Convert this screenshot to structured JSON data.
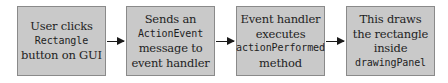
{
  "diagram": {
    "type": "flowchart",
    "direction": "left-to-right",
    "colors": {
      "box_fill": "#c9c9c9",
      "box_border": "#8a8a8a",
      "text": "#1e1e1e",
      "arrow": "#1a1a1a"
    },
    "steps": [
      {
        "id": "step-1",
        "lines": [
          {
            "text": "User clicks",
            "style": "serif"
          },
          {
            "text": "Rectangle",
            "style": "mono"
          },
          {
            "text": "button on GUI",
            "style": "serif"
          }
        ]
      },
      {
        "id": "step-2",
        "lines": [
          {
            "text": "Sends an",
            "style": "serif"
          },
          {
            "text": "ActionEvent",
            "style": "mono"
          },
          {
            "text": "message to",
            "style": "serif"
          },
          {
            "text": "event handler",
            "style": "serif"
          }
        ]
      },
      {
        "id": "step-3",
        "lines": [
          {
            "text": "Event handler",
            "style": "serif"
          },
          {
            "text": "executes",
            "style": "serif"
          },
          {
            "text": "actionPerformed",
            "style": "mono"
          },
          {
            "text": "method",
            "style": "serif"
          }
        ]
      },
      {
        "id": "step-4",
        "lines": [
          {
            "text": "This draws",
            "style": "serif"
          },
          {
            "text": "the rectangle",
            "style": "serif"
          },
          {
            "text": "inside",
            "style": "serif"
          },
          {
            "text": "drawingPanel",
            "style": "mono"
          }
        ]
      }
    ],
    "connections": [
      {
        "from": "step-1",
        "to": "step-2"
      },
      {
        "from": "step-2",
        "to": "step-3"
      },
      {
        "from": "step-3",
        "to": "step-4"
      }
    ]
  }
}
